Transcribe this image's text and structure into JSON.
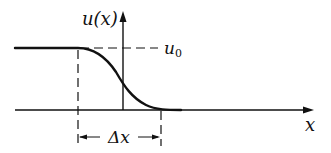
{
  "diagram": {
    "type": "step-profile",
    "labels": {
      "y_axis": "u(x)",
      "x_axis": "x",
      "level": "u",
      "level_subscript": "0",
      "width": "Δx"
    },
    "elements": [
      "x-axis with arrow",
      "y-axis with arrow",
      "solid curve (plateau at u0 then smooth fall to 0)",
      "dashed horizontal line at u0",
      "dashed vertical line at start of transition",
      "dashed vertical line at end of transition",
      "double-headed arrow labeled Δx"
    ],
    "colors": {
      "stroke": "#111111",
      "background": "#ffffff"
    }
  }
}
